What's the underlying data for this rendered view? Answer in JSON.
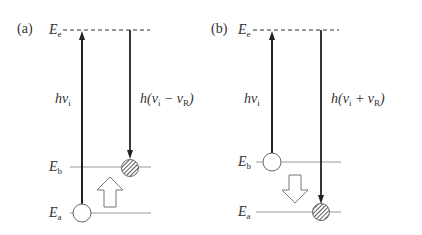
{
  "panels": [
    {
      "id": "a",
      "label": "(a)",
      "levels": {
        "Ee": "e",
        "Eb": "b",
        "Ea": "a"
      },
      "energy_symbol": "E",
      "excitation_label": {
        "h": "h",
        "nu": "ν",
        "sub": "i"
      },
      "emission_label": {
        "prefix": "h(ν",
        "sub1": "i",
        "op": " − ν",
        "sub2": "R",
        "suffix": ")"
      },
      "transition": "up",
      "description": "Stokes: excitation from Ea to virtual level Ee, emission down to Eb"
    },
    {
      "id": "b",
      "label": "(b)",
      "levels": {
        "Ee": "e",
        "Eb": "b",
        "Ea": "a"
      },
      "energy_symbol": "E",
      "excitation_label": {
        "h": "h",
        "nu": "ν",
        "sub": "i"
      },
      "emission_label": {
        "prefix": "h(ν",
        "sub1": "i",
        "op": " + ν",
        "sub2": "R",
        "suffix": ")"
      },
      "transition": "down",
      "description": "Anti-Stokes: excitation from Eb to virtual level Ee, emission down to Ea"
    }
  ],
  "colors": {
    "line": "#222222",
    "level": "#999999",
    "dash": "#333333"
  }
}
